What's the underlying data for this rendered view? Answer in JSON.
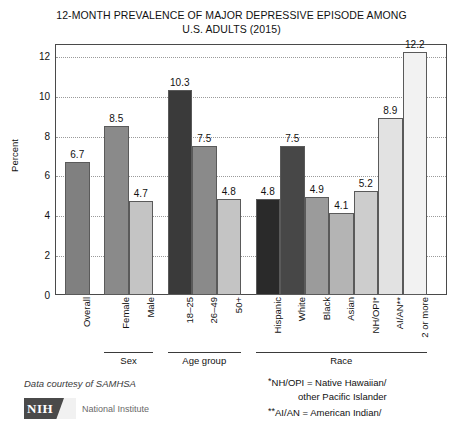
{
  "title": {
    "line1": "12-MONTH PREVALENCE OF MAJOR DEPRESSIVE EPISODE AMONG",
    "line2": "U.S. ADULTS (2015)"
  },
  "axis": {
    "ylabel": "Percent",
    "yticks": [
      "0",
      "2",
      "4",
      "6",
      "8",
      "10",
      "12"
    ]
  },
  "groups": [
    {
      "label": "",
      "underline": false
    },
    {
      "label": "Sex",
      "underline": true
    },
    {
      "label": "Age group",
      "underline": true
    },
    {
      "label": "Race",
      "underline": true
    }
  ],
  "notes": {
    "line1_marker": "*",
    "line1": "NH/OPI = Native Hawaiian/",
    "line2": "other Pacific Islander",
    "line3_marker": "**",
    "line3": "AI/AN = American Indian/"
  },
  "credit": "Data courtesy of SAMHSA",
  "logo": {
    "mark_text": "NIH",
    "name": "National Institute"
  },
  "chart_data": {
    "type": "bar",
    "title": "12-MONTH PREVALENCE OF MAJOR DEPRESSIVE EPISODE AMONG U.S. ADULTS (2015)",
    "xlabel": "",
    "ylabel": "Percent",
    "ylim": [
      0,
      12.6
    ],
    "yticks": [
      0,
      2,
      4,
      6,
      8,
      10,
      12
    ],
    "grid": true,
    "legend": "none",
    "categories": [
      "Overall",
      "Female",
      "Male",
      "18–25",
      "26–49",
      "50+",
      "Hispanic",
      "White",
      "Black",
      "Asian",
      "NH/OPI*",
      "AI/AN**",
      "2 or more"
    ],
    "values": [
      6.7,
      8.5,
      4.7,
      10.3,
      7.5,
      4.8,
      4.8,
      7.5,
      4.9,
      4.1,
      5.2,
      8.9,
      12.2
    ],
    "value_labels": [
      "6.7",
      "8.5",
      "4.7",
      "10.3",
      "7.5",
      "4.8",
      "4.8",
      "7.5",
      "4.9",
      "4.1",
      "5.2",
      "8.9",
      "12.2"
    ],
    "bar_colors": [
      "#808080",
      "#8a8a8a",
      "#c4c4c4",
      "#3a3a3a",
      "#8a8a8a",
      "#c4c4c4",
      "#2a2a2a",
      "#474747",
      "#9b9b9b",
      "#b4b4b4",
      "#cdcdcd",
      "#e2e2e2",
      "#f2f2f2"
    ],
    "groups": [
      {
        "name": "",
        "categories": [
          "Overall"
        ]
      },
      {
        "name": "Sex",
        "categories": [
          "Female",
          "Male"
        ]
      },
      {
        "name": "Age group",
        "categories": [
          "18–25",
          "26–49",
          "50+"
        ]
      },
      {
        "name": "Race",
        "categories": [
          "Hispanic",
          "White",
          "Black",
          "Asian",
          "NH/OPI*",
          "AI/AN**",
          "2 or more"
        ]
      }
    ]
  }
}
